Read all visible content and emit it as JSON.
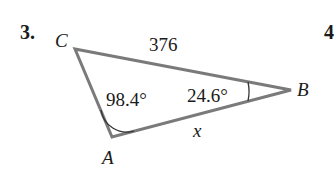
{
  "problem": {
    "number": "3.",
    "next_number": "4"
  },
  "triangle": {
    "vertices": {
      "A": {
        "label": "A",
        "x": 112,
        "y": 137
      },
      "B": {
        "label": "B",
        "x": 291,
        "y": 90
      },
      "C": {
        "label": "C",
        "x": 75,
        "y": 49
      }
    },
    "sides": {
      "CB": "376",
      "AB": "x"
    },
    "angles": {
      "A": "98.4°",
      "B": "24.6°"
    },
    "stroke_color": "#7a7a7a"
  }
}
